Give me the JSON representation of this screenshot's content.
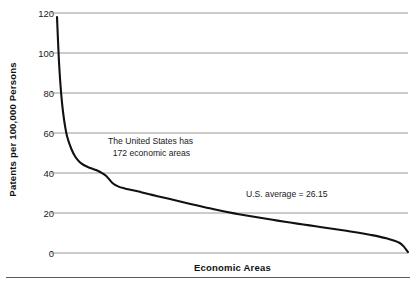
{
  "chart_data": {
    "type": "line",
    "title": "",
    "subtitle": "",
    "xlabel": "Economic Areas",
    "ylabel": "Patents per 100,000 Persons",
    "ylim": [
      0,
      120
    ],
    "yticks": [
      0,
      20,
      40,
      60,
      80,
      100,
      120
    ],
    "ytick_labels": [
      "0",
      "20",
      "40",
      "60",
      "80",
      "100",
      "120"
    ],
    "xlim": [
      1,
      172
    ],
    "xticks": [],
    "xtick_labels": [],
    "grid": "horizontal",
    "legend": "none",
    "series": [
      {
        "name": "Patents per 100,000 persons by economic area (rank ordered)",
        "color": "#111111",
        "x": [
          1,
          2,
          3,
          4,
          5,
          6,
          8,
          10,
          12,
          14,
          16,
          18,
          20,
          22,
          25,
          28,
          31,
          34,
          38,
          42,
          46,
          50,
          55,
          60,
          65,
          70,
          76,
          82,
          88,
          94,
          100,
          106,
          112,
          118,
          124,
          130,
          136,
          142,
          148,
          154,
          158,
          162,
          165,
          168,
          170,
          171,
          172
        ],
        "values": [
          118.0,
          95.0,
          80.0,
          70.0,
          63.0,
          58.0,
          52.0,
          48.0,
          45.5,
          44.0,
          43.0,
          42.2,
          41.5,
          40.5,
          38.5,
          35.0,
          33.2,
          32.3,
          31.4,
          30.4,
          29.4,
          28.4,
          27.2,
          26.0,
          24.8,
          23.6,
          22.2,
          20.9,
          19.7,
          18.6,
          17.6,
          16.6,
          15.6,
          14.7,
          13.8,
          12.9,
          12.0,
          11.1,
          10.1,
          9.0,
          8.2,
          7.2,
          6.3,
          5.0,
          3.2,
          1.8,
          0.4
        ]
      }
    ],
    "annotations": [
      {
        "name": "us-economic-areas-note",
        "text": "The United States has\n  172 economic areas",
        "x_value": 18,
        "y_value": 48
      },
      {
        "name": "us-average-note",
        "text": "U.S. average = 26.15",
        "x_value": 100,
        "y_value": 24
      }
    ]
  },
  "axes": {
    "y_title": "Patents per 100,000 Persons",
    "x_title": "Economic Areas"
  },
  "colors": {
    "line": "#111111",
    "gridline": "#8c8c8c",
    "text": "#1a1a1a",
    "background": "#ffffff",
    "bottom_rule": "#5b5b5b"
  }
}
